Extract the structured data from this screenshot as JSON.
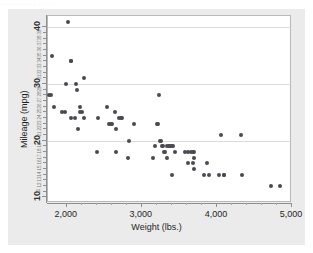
{
  "top_strip": {
    "text": "·   ·   ·     ·       ·  ·   ·      · · · · · ·"
  },
  "figure": {
    "background_color": "#ebebeb",
    "panel_color": "#ffffff",
    "panel_border_color": "#b9b9b9",
    "grid_color": "#dcdcdc",
    "point_color": "#4a4a52",
    "axis_color": "#8f8f8f"
  },
  "chart_data": {
    "type": "scatter",
    "title": "",
    "xlabel": "Weight (lbs.)",
    "ylabel": "Mileage (mpg)",
    "xlim": [
      1750,
      5000
    ],
    "ylim": [
      9,
      42
    ],
    "grid": "horizontal",
    "legend": "none",
    "x_major_ticks": [
      2000,
      3000,
      4000,
      5000
    ],
    "x_major_tick_labels": [
      "2,000",
      "3,000",
      "4,000",
      "5,000"
    ],
    "x_minor_ticks": [
      2200,
      2400,
      2600,
      2800,
      3200,
      3400,
      3600,
      3800,
      4200,
      4400,
      4600,
      4800
    ],
    "y_major_ticks": [
      10,
      20,
      30,
      40
    ],
    "y_major_tick_labels": [
      "10",
      "20",
      "30",
      "40"
    ],
    "y_minor_ticks": [
      11,
      12,
      13,
      14,
      15,
      16,
      17,
      18,
      19,
      21,
      22,
      23,
      24,
      25,
      26,
      27,
      28,
      29,
      31,
      32,
      33,
      34,
      35,
      36,
      37,
      38,
      39
    ],
    "y_minor_tick_labels": [
      "11",
      "12",
      "13",
      "14",
      "15",
      "16",
      "17",
      "18",
      "19",
      "21",
      "22",
      "23",
      "24",
      "25",
      "26",
      "27",
      "28",
      "29",
      "31",
      "32",
      "33",
      "34",
      "35",
      "36",
      "37",
      "38",
      "39"
    ],
    "y_gridlines": [
      20,
      30,
      40
    ],
    "point_count": 74,
    "points": [
      [
        2020,
        41
      ],
      [
        1800,
        35
      ],
      [
        2050,
        34
      ],
      [
        2060,
        34
      ],
      [
        1990,
        30
      ],
      [
        2120,
        30
      ],
      [
        2230,
        31
      ],
      [
        2130,
        29
      ],
      [
        1760,
        28
      ],
      [
        1790,
        28
      ],
      [
        3230,
        28
      ],
      [
        1830,
        26
      ],
      [
        1930,
        25
      ],
      [
        1970,
        25
      ],
      [
        2180,
        26
      ],
      [
        2170,
        25
      ],
      [
        2200,
        25
      ],
      [
        2530,
        26
      ],
      [
        2640,
        25
      ],
      [
        2060,
        24
      ],
      [
        2110,
        24
      ],
      [
        2230,
        24
      ],
      [
        2410,
        24
      ],
      [
        2690,
        24
      ],
      [
        2720,
        24
      ],
      [
        2740,
        24
      ],
      [
        2150,
        22
      ],
      [
        2560,
        23
      ],
      [
        2590,
        23
      ],
      [
        2600,
        23
      ],
      [
        2660,
        22
      ],
      [
        2900,
        23
      ],
      [
        3200,
        23
      ],
      [
        3210,
        23
      ],
      [
        4060,
        21
      ],
      [
        4320,
        21
      ],
      [
        2830,
        20
      ],
      [
        3240,
        20
      ],
      [
        3250,
        20
      ],
      [
        3270,
        19
      ],
      [
        3280,
        19
      ],
      [
        3180,
        19
      ],
      [
        3340,
        19
      ],
      [
        3360,
        19
      ],
      [
        3380,
        19
      ],
      [
        3400,
        19
      ],
      [
        3410,
        19
      ],
      [
        2400,
        18
      ],
      [
        2650,
        18
      ],
      [
        3300,
        18
      ],
      [
        3310,
        18
      ],
      [
        3440,
        18
      ],
      [
        3580,
        18
      ],
      [
        3620,
        18
      ],
      [
        3660,
        18
      ],
      [
        3680,
        18
      ],
      [
        3700,
        18
      ],
      [
        2810,
        17
      ],
      [
        3150,
        17
      ],
      [
        3330,
        17
      ],
      [
        3700,
        17
      ],
      [
        3610,
        16
      ],
      [
        3680,
        16
      ],
      [
        3870,
        16
      ],
      [
        3700,
        15
      ],
      [
        3400,
        14
      ],
      [
        3830,
        14
      ],
      [
        3890,
        14
      ],
      [
        4030,
        14
      ],
      [
        4090,
        14
      ],
      [
        4100,
        14
      ],
      [
        4330,
        14
      ],
      [
        4720,
        12
      ],
      [
        4840,
        12
      ]
    ]
  }
}
